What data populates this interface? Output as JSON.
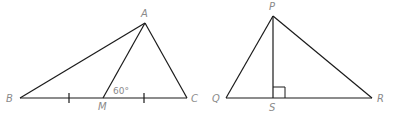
{
  "figures": [
    {
      "name": "triangle-ABC",
      "vertices": [
        "A",
        "B",
        "C"
      ],
      "extra_points": [
        "M"
      ],
      "segments": [
        "AB",
        "BC",
        "CA",
        "AM"
      ],
      "congruence_marks": [
        "BM",
        "MC"
      ],
      "angle_label": {
        "text": "60°",
        "at": "M",
        "between": [
          "MA",
          "MC"
        ]
      },
      "labels": {
        "A": "A",
        "B": "B",
        "C": "C",
        "M": "M"
      }
    },
    {
      "name": "triangle-PQR",
      "vertices": [
        "P",
        "Q",
        "R"
      ],
      "extra_points": [
        "S"
      ],
      "segments": [
        "PQ",
        "QR",
        "RP",
        "PS"
      ],
      "right_angle_at": "S",
      "labels": {
        "P": "P",
        "Q": "Q",
        "R": "R",
        "S": "S"
      }
    }
  ],
  "angle_text": "60°"
}
